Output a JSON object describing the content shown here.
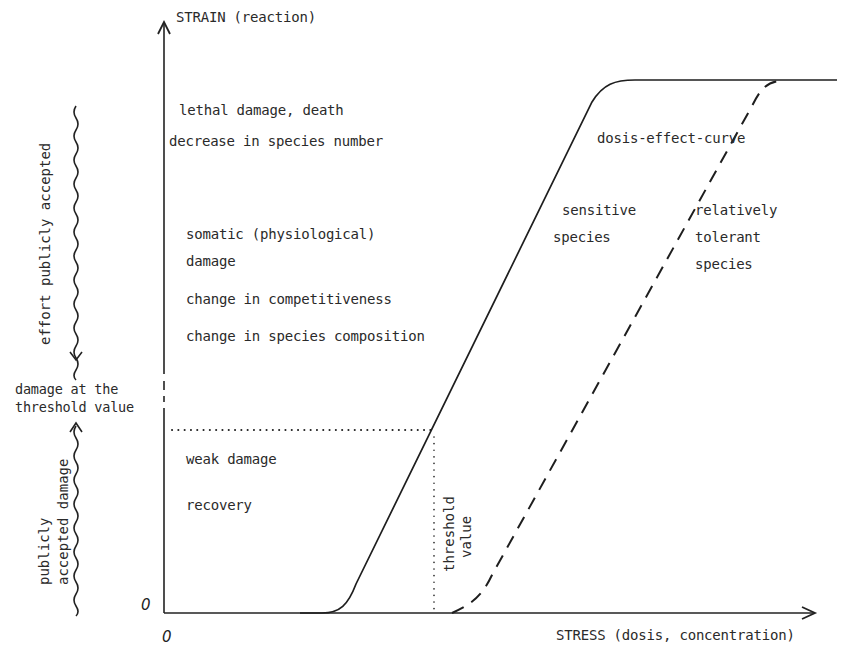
{
  "axes": {
    "y_label": "STRAIN (reaction)",
    "x_label": "STRESS (dosis, concentration)",
    "y_origin": "0",
    "x_origin": "0"
  },
  "levels": {
    "lethal": "lethal damage, death",
    "decrease": "decrease in species number",
    "somatic_line1": "somatic (physiological)",
    "somatic_line2": "damage",
    "competitiveness": "change in competitiveness",
    "composition": "change in species composition",
    "weak": "weak damage",
    "recovery": "recovery"
  },
  "left_annotations": {
    "effort": "effort publicly accepted",
    "threshold_damage_line1": "damage at the",
    "threshold_damage_line2": "threshold value",
    "accepted_line1": "publicly",
    "accepted_line2": "accepted damage"
  },
  "curves": {
    "title": "dosis-effect-curve",
    "sensitive_line1": "sensitive",
    "sensitive_line2": "species",
    "tolerant_line1": "relatively",
    "tolerant_line2": "tolerant",
    "tolerant_line3": "species"
  },
  "threshold": {
    "line1": "threshold",
    "line2": "value"
  },
  "colors": {
    "ink": "#222222",
    "background": "#ffffff"
  }
}
